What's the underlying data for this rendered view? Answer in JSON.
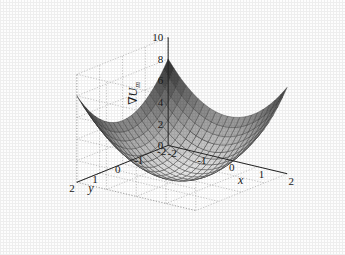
{
  "figure": {
    "background_color": "#fdfdfd",
    "axis_color": "#262626",
    "grid_color": "#9a9a9a",
    "surface_edge_color": "#2a2a2a"
  },
  "axes": {
    "z": {
      "title": "∇U",
      "title_sub": "m",
      "ticks": [
        0,
        2,
        4,
        6,
        8,
        10
      ],
      "tick_labels": [
        "0",
        "2",
        "4",
        "6",
        "8",
        "10"
      ],
      "lim": [
        0,
        10
      ]
    },
    "x": {
      "title": "x",
      "ticks": [
        -2,
        -1,
        0,
        1,
        2
      ],
      "tick_labels": [
        "-2",
        "-1",
        "0",
        "1",
        "2"
      ],
      "lim": [
        -2,
        2
      ]
    },
    "y": {
      "title": "y",
      "ticks": [
        2,
        1,
        0,
        -1,
        -2
      ],
      "tick_labels": [
        "2",
        "1",
        "0",
        "-1",
        "-2"
      ],
      "lim": [
        -2,
        2
      ]
    }
  },
  "chart_data": {
    "type": "surface",
    "title": "",
    "xlabel": "x",
    "ylabel": "y",
    "zlabel": "∇U_m",
    "xlim": [
      -2,
      2
    ],
    "ylim": [
      -2,
      2
    ],
    "zlim": [
      0,
      10
    ],
    "grid": true,
    "legend": "none",
    "colormap": "gray",
    "formula": "z = x^2 + y^2",
    "mesh_divisions": 20,
    "x": [
      -2,
      -1.8,
      -1.6,
      -1.4,
      -1.2,
      -1,
      -0.8,
      -0.6,
      -0.4,
      -0.2,
      0,
      0.2,
      0.4,
      0.6,
      0.8,
      1,
      1.2,
      1.4,
      1.6,
      1.8,
      2
    ],
    "y": [
      -2,
      -1.8,
      -1.6,
      -1.4,
      -1.2,
      -1,
      -0.8,
      -0.6,
      -0.4,
      -0.2,
      0,
      0.2,
      0.4,
      0.6,
      0.8,
      1,
      1.2,
      1.4,
      1.6,
      1.8,
      2
    ],
    "z_corner_values": [
      8,
      8,
      8,
      8
    ],
    "z_min": 0,
    "z_max": 8,
    "z_at_origin": 0,
    "view_azimuth": -37.5,
    "view_elevation": 30
  }
}
